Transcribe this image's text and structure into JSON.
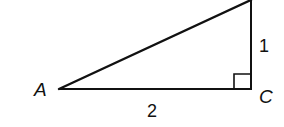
{
  "diagram": {
    "type": "right-triangle",
    "vertices": {
      "A": {
        "label": "A"
      },
      "C": {
        "label": "C"
      }
    },
    "sides": {
      "horizontal": {
        "label": "2"
      },
      "vertical": {
        "label": "1"
      }
    },
    "right_angle_at": "C",
    "stroke_color": "#111111",
    "background": "#ffffff"
  }
}
